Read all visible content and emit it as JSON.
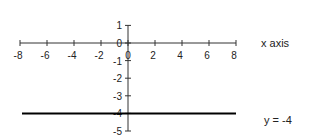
{
  "chart_data": {
    "type": "line",
    "title": "",
    "xlabel": "x axis",
    "ylabel": "",
    "xlim": [
      -8,
      8
    ],
    "ylim": [
      -5,
      1
    ],
    "grid": false,
    "x_ticks": [
      -8,
      -6,
      -4,
      -2,
      0,
      2,
      4,
      6,
      8
    ],
    "y_ticks": [
      1,
      0,
      -1,
      -2,
      -3,
      -4,
      -5
    ],
    "series": [
      {
        "name": "y = -4",
        "x": [
          -8,
          8
        ],
        "y": [
          -4,
          -4
        ],
        "color": "#000000"
      }
    ],
    "annotations": [
      "x axis",
      "y = -4"
    ],
    "legend": {
      "position": "right"
    }
  },
  "labels": {
    "x_axis": "x axis",
    "line": "y = -4"
  },
  "colors": {
    "axis": "#333333",
    "line": "#000000",
    "text": "#222222"
  }
}
